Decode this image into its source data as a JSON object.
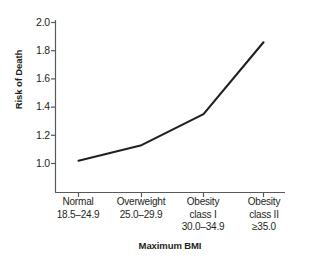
{
  "chart_data": {
    "type": "line",
    "title": "",
    "xlabel": "Maximum BMI",
    "ylabel": "Risk of Death",
    "categories": [
      "Normal",
      "Overweight",
      "Obesity class I",
      "Obesity class II"
    ],
    "category_ranges": [
      "18.5–24.9",
      "25.0–29.9",
      "30.0–34.9",
      "≥35.0"
    ],
    "values": [
      1.02,
      1.13,
      1.35,
      1.86
    ],
    "series": [
      {
        "name": "Risk of Death",
        "values": [
          1.02,
          1.13,
          1.35,
          1.86
        ]
      }
    ],
    "ylim": [
      1.0,
      2.0
    ],
    "yticks": [
      "1.0",
      "1.2",
      "1.4",
      "1.6",
      "1.8",
      "2.0"
    ],
    "ytick_values": [
      1.0,
      1.2,
      1.4,
      1.6,
      1.8,
      2.0
    ],
    "grid": false,
    "legend": "none",
    "line_color": "#231f20",
    "axis_color": "#58595b",
    "text_color": "#231f20"
  },
  "axes": {
    "y_label": "Risk of Death",
    "x_label": "Maximum BMI"
  },
  "y_ticks": [
    {
      "label": "2.0"
    },
    {
      "label": "1.8"
    },
    {
      "label": "1.6"
    },
    {
      "label": "1.4"
    },
    {
      "label": "1.2"
    },
    {
      "label": "1.0"
    }
  ],
  "x_categories": [
    {
      "line1": "Normal",
      "line2": "18.5–24.9",
      "line3": ""
    },
    {
      "line1": "Overweight",
      "line2": "25.0–29.9",
      "line3": ""
    },
    {
      "line1": "Obesity",
      "line2": "class I",
      "line3": "30.0–34.9"
    },
    {
      "line1": "Obesity",
      "line2": "class II",
      "line3": "≥35.0"
    }
  ]
}
